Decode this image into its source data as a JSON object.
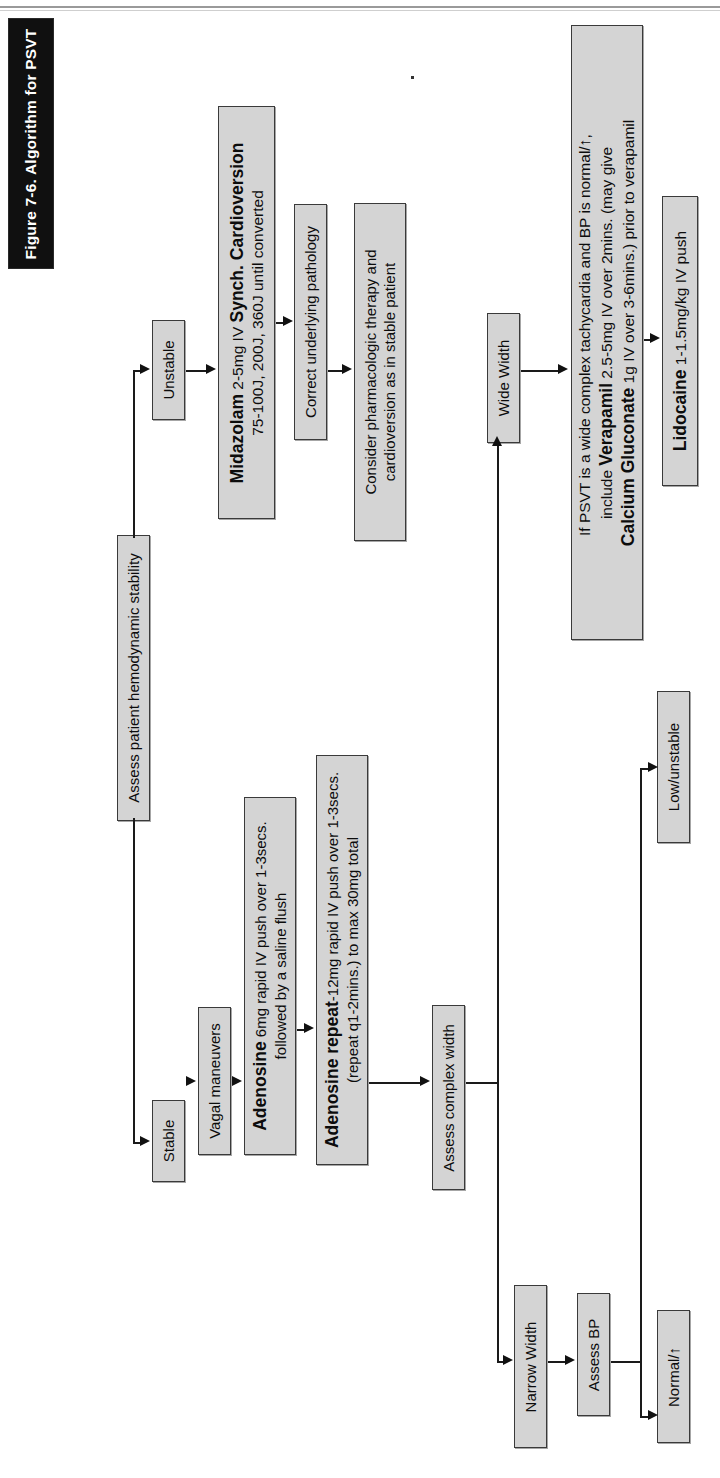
{
  "figure": {
    "title": "Figure 7-6. Algorithm for PSVT",
    "title_bar_color": "#101010",
    "box_fill": "#d4d4d4",
    "box_border": "#3a3a3a",
    "orientation": "rotated-90-ccw"
  },
  "flowchart": {
    "type": "flowchart",
    "nodes": [
      {
        "id": "assess-stability",
        "label": "Assess patient hemodynamic stability"
      },
      {
        "id": "stable",
        "label": "Stable"
      },
      {
        "id": "unstable",
        "label": "Unstable"
      },
      {
        "id": "midazolam",
        "line1_bold": "Midazolam",
        "line1_rest": " 2-5mg IV ",
        "line1_bold2": "Synch. Cardioversion",
        "line2": "75-100J, 200J, 360J until converted"
      },
      {
        "id": "correct-pathology",
        "label": "Correct underlying pathology"
      },
      {
        "id": "consider-pharm",
        "line1": "Consider pharmacologic therapy and",
        "line2": "cardioversion as in stable patient"
      },
      {
        "id": "vagal",
        "label": "Vagal maneuvers"
      },
      {
        "id": "adenosine-6",
        "line1_bold": "Adenosine",
        "line1_rest": " 6mg rapid IV push over 1-3secs.",
        "line2": "followed by a saline flush"
      },
      {
        "id": "adenosine-12",
        "line1_bold": "Adenosine repeat",
        "line1_rest": "-12mg rapid IV push over 1-3secs.",
        "line2": "(repeat q1-2mins.) to max 30mg total"
      },
      {
        "id": "assess-width",
        "label": "Assess complex width"
      },
      {
        "id": "narrow-width",
        "label": "Narrow Width"
      },
      {
        "id": "wide-width",
        "label": "Wide Width"
      },
      {
        "id": "assess-bp",
        "label": "Assess BP"
      },
      {
        "id": "normal-bp",
        "label": "Normal/↑"
      },
      {
        "id": "low-unstable",
        "label": "Low/unstable"
      },
      {
        "id": "verapamil",
        "line1": "If PSVT is a wide complex tachycardia and BP is normal/↑, ",
        "line2_pre": "include ",
        "line2_bold": "Verapamil",
        "line2_rest": " 2.5-5mg IV over 2mins. (may give",
        "line3_bold": "Calcium Gluconate",
        "line3_rest": " 1g IV over 3-6mins.) prior to verapamil"
      },
      {
        "id": "lidocaine",
        "bold": "Lidocaine",
        "rest": " 1-1.5mg/kg IV push"
      }
    ],
    "edges": [
      {
        "from": "assess-stability",
        "to": "stable"
      },
      {
        "from": "assess-stability",
        "to": "unstable"
      },
      {
        "from": "unstable",
        "to": "midazolam"
      },
      {
        "from": "midazolam",
        "to": "correct-pathology"
      },
      {
        "from": "correct-pathology",
        "to": "consider-pharm"
      },
      {
        "from": "stable",
        "to": "vagal"
      },
      {
        "from": "vagal",
        "to": "adenosine-6"
      },
      {
        "from": "adenosine-6",
        "to": "adenosine-12"
      },
      {
        "from": "adenosine-12",
        "to": "assess-width"
      },
      {
        "from": "assess-width",
        "to": "narrow-width"
      },
      {
        "from": "assess-width",
        "to": "wide-width"
      },
      {
        "from": "narrow-width",
        "to": "assess-bp"
      },
      {
        "from": "assess-bp",
        "to": "normal-bp"
      },
      {
        "from": "assess-bp",
        "to": "low-unstable"
      },
      {
        "from": "wide-width",
        "to": "verapamil"
      },
      {
        "from": "verapamil",
        "to": "lidocaine"
      }
    ]
  }
}
